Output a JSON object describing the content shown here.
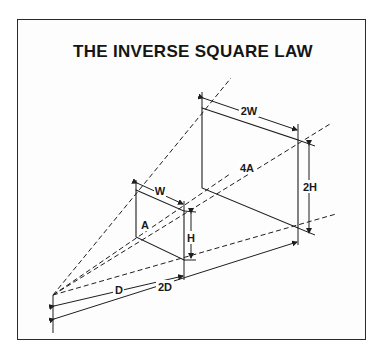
{
  "diagram": {
    "title": "THE INVERSE SQUARE LAW",
    "labels": {
      "small_width": "W",
      "small_height": "H",
      "small_area": "A",
      "large_width": "2W",
      "large_height": "2H",
      "large_area": "4A",
      "near_distance": "D",
      "far_distance": "2D"
    },
    "colors": {
      "line": "#1e1e1e",
      "background": "#ffffff"
    }
  }
}
